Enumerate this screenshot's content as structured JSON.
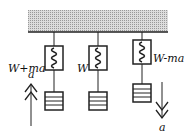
{
  "diagram": {
    "scales": [
      {
        "label": "W+ma",
        "acceleration": "up",
        "accel_label": "a"
      },
      {
        "label": "W",
        "acceleration": "none"
      },
      {
        "label": "W-ma",
        "acceleration": "down",
        "accel_label": "a"
      }
    ]
  }
}
